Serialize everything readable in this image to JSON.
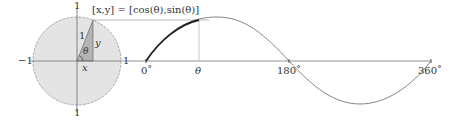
{
  "diagram": {
    "unit_circle": {
      "top_label": "1",
      "bottom_label": "1",
      "left_label": "−1",
      "right_label": "1",
      "hypotenuse_label": "1",
      "y_label": "y",
      "x_label": "x",
      "angle_label": "θ",
      "fill_color": "#e4e4e4",
      "triangle_color": "#b4b4b4"
    },
    "point_label": "[x,y] = [cos(θ),sin(θ)]",
    "sine_wave": {
      "tick_0": "0˚",
      "tick_theta": "θ",
      "tick_180": "180˚",
      "tick_360": "360˚"
    }
  }
}
